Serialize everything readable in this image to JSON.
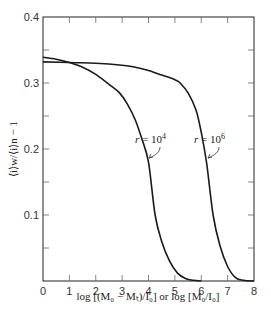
{
  "chart_data": {
    "type": "line",
    "title": "",
    "xlabel": "log [(M₀ − Mₜ)/I₀] or log [M₀/I₀]",
    "ylabel": "⟨i⟩w/⟨i⟩n − 1",
    "xlim": [
      0,
      8
    ],
    "ylim": [
      0,
      0.4
    ],
    "grid": false,
    "legend": "none (inline curve labels)",
    "x_ticks": [
      "0",
      "1",
      "2",
      "3",
      "4",
      "5",
      "6",
      "7",
      "8"
    ],
    "y_ticks": [
      "0.1",
      "0.2",
      "0.3",
      "0.4"
    ],
    "series": [
      {
        "name": "r = 10^4",
        "label": "r = 10",
        "label_exp": "4",
        "x": [
          0,
          0.5,
          1.0,
          1.5,
          2.0,
          2.5,
          2.9,
          3.2,
          3.5,
          3.75,
          4.0,
          4.25,
          4.5,
          4.8,
          5.1,
          5.4,
          5.7,
          6.0
        ],
        "y": [
          0.339,
          0.336,
          0.331,
          0.324,
          0.313,
          0.298,
          0.285,
          0.268,
          0.244,
          0.215,
          0.18,
          0.1,
          0.06,
          0.03,
          0.012,
          0.004,
          0.001,
          0.0
        ]
      },
      {
        "name": "r = 10^6",
        "label": "r = 10",
        "label_exp": "6",
        "x": [
          0,
          1.0,
          2.0,
          3.0,
          3.5,
          4.0,
          4.5,
          5.0,
          5.2,
          5.5,
          5.8,
          6.0,
          6.2,
          6.45,
          6.7,
          7.0,
          7.3,
          7.6,
          8.0
        ],
        "y": [
          0.332,
          0.331,
          0.33,
          0.327,
          0.324,
          0.319,
          0.312,
          0.305,
          0.3,
          0.285,
          0.259,
          0.225,
          0.18,
          0.1,
          0.055,
          0.022,
          0.005,
          0.001,
          0.0
        ]
      }
    ]
  },
  "annotations": [
    {
      "text": "r = 10",
      "sup": "4",
      "points_to": "r = 10^4 curve"
    },
    {
      "text": "r = 10",
      "sup": "6",
      "points_to": "r = 10^6 curve"
    }
  ]
}
